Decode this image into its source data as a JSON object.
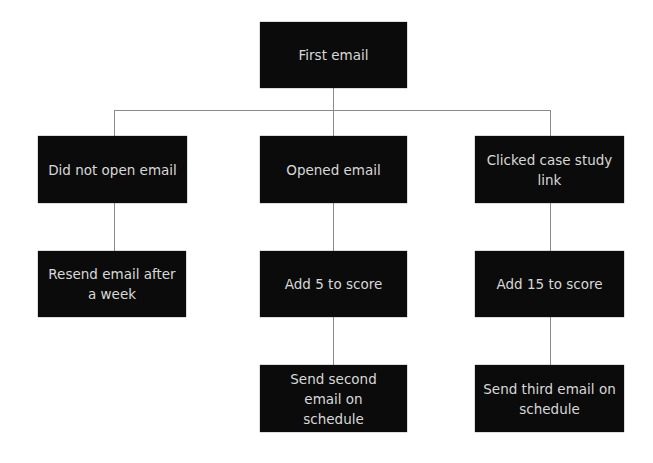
{
  "diagram": {
    "type": "flowchart",
    "nodes": {
      "root": {
        "label": "First email"
      },
      "not_opened": {
        "label": "Did not open email"
      },
      "opened": {
        "label": "Opened email"
      },
      "clicked": {
        "label": "Clicked case study link"
      },
      "resend": {
        "label": "Resend email after a week"
      },
      "add5": {
        "label": "Add 5 to score"
      },
      "add15": {
        "label": "Add 15 to score"
      },
      "second_email": {
        "label": "Send second email on schedule"
      },
      "third_email": {
        "label": "Send third email on schedule"
      }
    },
    "edges": [
      {
        "from": "First email",
        "to": "Did not open email"
      },
      {
        "from": "First email",
        "to": "Opened email"
      },
      {
        "from": "First email",
        "to": "Clicked case study link"
      },
      {
        "from": "Did not open email",
        "to": "Resend email after a week"
      },
      {
        "from": "Opened email",
        "to": "Add 5 to score"
      },
      {
        "from": "Add 5 to score",
        "to": "Send second email on schedule"
      },
      {
        "from": "Clicked case study link",
        "to": "Add 15 to score"
      },
      {
        "from": "Add 15 to score",
        "to": "Send third email on schedule"
      }
    ],
    "colors": {
      "box_fill": "#0b0b0b",
      "box_text": "#d8d8d8",
      "connector": "#8a8a8a",
      "background": "#ffffff"
    }
  }
}
